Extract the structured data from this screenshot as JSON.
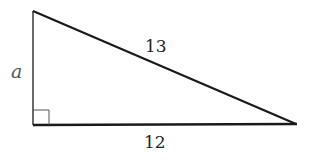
{
  "diagram": {
    "type": "right-triangle",
    "vertices": {
      "top_left": [
        33,
        11
      ],
      "bottom_left": [
        33,
        125
      ],
      "right": [
        296,
        124
      ]
    },
    "right_angle_at": "bottom_left",
    "labels": {
      "vertical_leg": "a",
      "hypotenuse": "13",
      "horizontal_leg": "12"
    },
    "colors": {
      "stroke": "#1a1a1a",
      "label": "#222222",
      "variable_label": "#555555",
      "background": "#ffffff"
    }
  }
}
